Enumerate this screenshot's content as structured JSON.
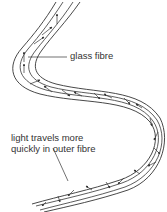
{
  "diagram": {
    "type": "optical-fibre-total-internal-reflection",
    "labels": {
      "glass_fibre": "glass fibre",
      "light_line1": "light travels more",
      "light_line2": "quickly in outer fibre"
    },
    "colors": {
      "line": "#333333",
      "text": "#333333",
      "background": "#ffffff"
    }
  }
}
